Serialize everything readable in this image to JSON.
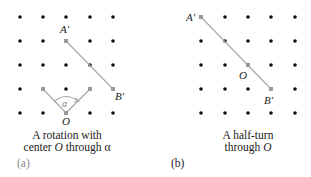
{
  "panels": [
    {
      "id": "a",
      "tag": "(a)",
      "caption_line1": "A rotation with",
      "caption_line2_pre": "center ",
      "caption_line2_var": "O",
      "caption_line2_post": " through ",
      "caption_line2_angle": "α",
      "labels": {
        "A": "A′",
        "B": "B′",
        "O": "O",
        "alpha": "α"
      }
    },
    {
      "id": "b",
      "tag": "(b)",
      "caption_line1": "A half-turn",
      "caption_line2_pre": "through ",
      "caption_line2_var": "O",
      "labels": {
        "A": "A′",
        "B": "B′",
        "O": "O"
      }
    }
  ],
  "colors": {
    "dot": "#111111",
    "line": "#aaaaaa",
    "tag_a": "#888888",
    "tag_b": "#222222"
  }
}
